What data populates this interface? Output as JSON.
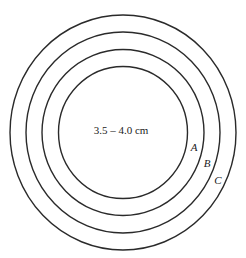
{
  "diagram": {
    "center_label": "3.5 – 4.0 cm",
    "rings": [
      {
        "id": "inner",
        "label": "A"
      },
      {
        "id": "middle",
        "label": "B"
      },
      {
        "id": "outer",
        "label": "C"
      }
    ],
    "colors": {
      "stroke": "#2a2a2a",
      "background": "#ffffff"
    }
  }
}
